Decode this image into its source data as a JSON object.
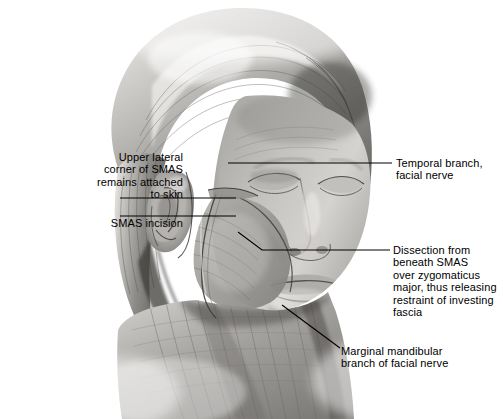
{
  "figure": {
    "kind": "medical-illustration",
    "background_color": "#ffffff",
    "ink_color": "#000000",
    "palette": {
      "skin_light": "#d8d6d2",
      "skin_mid": "#a9a7a3",
      "skin_dark": "#6f6d6a",
      "hair_light": "#cfcdc9",
      "hair_mid": "#8e8c88",
      "hair_dark": "#4a4846",
      "muscle_mid": "#9b9994",
      "shadow": "#5a5856"
    }
  },
  "labels": {
    "upper_lateral": "Upper lateral\ncorner of SMAS\nremains attached\nto skin",
    "smas_incision": "SMAS incision",
    "temporal_branch": "Temporal branch,\nfacial nerve",
    "dissection": "Dissection from\nbeneath SMAS\nover zygomaticus\nmajor, thus releasing\nrestraint of investing\nfascia",
    "marginal_mandibular": "Marginal mandibular\nbranch of facial nerve"
  },
  "leaders": [
    {
      "name": "leader-upper-lateral",
      "points": "120,198 236,198"
    },
    {
      "name": "leader-smas-incision",
      "points": "120,216 236,216"
    },
    {
      "name": "leader-temporal-branch",
      "points": "228,163 392,163"
    },
    {
      "name": "leader-dissection",
      "points": "238,232 262,250 390,250"
    },
    {
      "name": "leader-marginal-mandibular",
      "points": "340,348 282,305"
    }
  ]
}
